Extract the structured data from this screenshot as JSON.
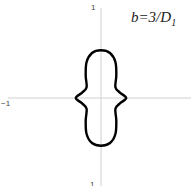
{
  "chart_data": {
    "type": "line",
    "subtype": "polar-curve",
    "title": "",
    "annotation": {
      "text": "b=3/D",
      "subscript": "1"
    },
    "xlabel": "",
    "ylabel": "",
    "xlim": [
      -1,
      1
    ],
    "ylim": [
      -1,
      1
    ],
    "x_tick_labels": [
      "−1",
      "1"
    ],
    "y_tick_labels": [
      "1",
      "1"
    ],
    "grid": false,
    "axes_color": "#d0d0d0",
    "curve_color": "#000000",
    "series": [
      {
        "name": "b=3/D1",
        "points_xy": [
          [
            0.0,
            0.53
          ],
          [
            0.1,
            0.5
          ],
          [
            0.16,
            0.4
          ],
          [
            0.17,
            0.25
          ],
          [
            0.16,
            0.12
          ],
          [
            0.21,
            0.06
          ],
          [
            0.28,
            0.0
          ],
          [
            0.21,
            -0.06
          ],
          [
            0.16,
            -0.12
          ],
          [
            0.17,
            -0.25
          ],
          [
            0.16,
            -0.4
          ],
          [
            0.1,
            -0.5
          ],
          [
            0.0,
            -0.53
          ],
          [
            -0.1,
            -0.5
          ],
          [
            -0.16,
            -0.4
          ],
          [
            -0.17,
            -0.25
          ],
          [
            -0.16,
            -0.12
          ],
          [
            -0.21,
            -0.06
          ],
          [
            -0.28,
            0.0
          ],
          [
            -0.21,
            0.06
          ],
          [
            -0.16,
            0.12
          ],
          [
            -0.17,
            0.25
          ],
          [
            -0.16,
            0.4
          ],
          [
            -0.1,
            0.5
          ],
          [
            0.0,
            0.53
          ]
        ]
      }
    ]
  },
  "labels": {
    "y_top": "1",
    "y_bottom": "1",
    "x_left": "−1",
    "annotation_main": "b=3/D",
    "annotation_sub": "1"
  }
}
